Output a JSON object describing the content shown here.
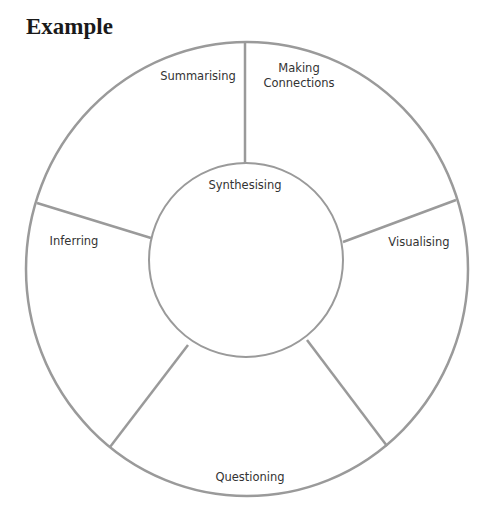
{
  "title": "Example",
  "diagram": {
    "type": "segmented-wheel",
    "stroke_color": "#9a9a9a",
    "text_color": "#333333",
    "center": {
      "label": "Synthesising"
    },
    "segments": [
      {
        "label": "Summarising"
      },
      {
        "label": "Making\nConnections"
      },
      {
        "label": "Visualising"
      },
      {
        "label": "Questioning"
      },
      {
        "label": "Inferring"
      }
    ]
  }
}
